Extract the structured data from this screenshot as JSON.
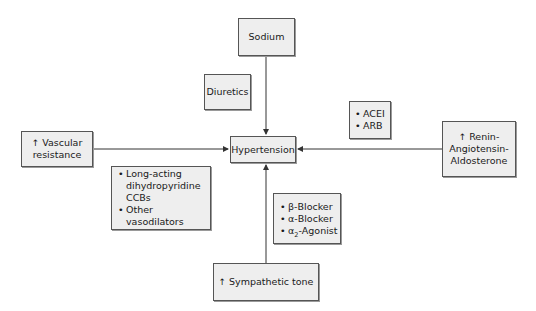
{
  "diagram": {
    "center": {
      "label": "Hypertension"
    },
    "causes": {
      "sodium": {
        "label": "Sodium"
      },
      "vascular": {
        "prefix": "↑",
        "line1": "Vascular",
        "line2": "resistance"
      },
      "raas": {
        "prefix": "↑",
        "line1": "Renin-",
        "line2": "Angiotensin-",
        "line3": "Aldosterone"
      },
      "sympathetic": {
        "prefix": "↑",
        "label": "Sympathetic tone"
      }
    },
    "treatments": {
      "sodium": {
        "items": [
          "Diuretics"
        ]
      },
      "vascular": {
        "items": [
          "Long-acting",
          "dihydropyridine",
          "CCBs",
          "Other vasodilators"
        ]
      },
      "raas": {
        "items": [
          "ACEI",
          "ARB"
        ]
      },
      "sympathetic": {
        "items": [
          "β-Blocker",
          "α-Blocker",
          "α",
          "2",
          "-Agonist"
        ]
      }
    },
    "colors": {
      "box_fill": "#eeeeee",
      "box_border": "#555555",
      "line": "#333333"
    }
  }
}
